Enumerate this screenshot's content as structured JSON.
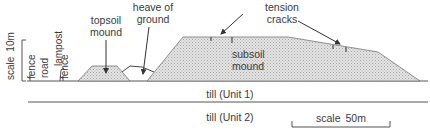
{
  "diagram": {
    "type": "geological cross-section",
    "colors": {
      "line": "#555555",
      "fill": "#d9d9d9",
      "text": "#3a3a3a"
    },
    "vertical_scale": {
      "label": "scale",
      "value": "10m"
    },
    "horizontal_scale": {
      "label": "scale",
      "value": "50m"
    },
    "features": {
      "fence_left": "fence",
      "road": "road",
      "lampost": "lampost",
      "fence_right": "fence",
      "topsoil_line1": "topsoil",
      "topsoil_line2": "mound",
      "heave_line1": "heave of",
      "heave_line2": "ground",
      "tension_line1": "tension",
      "tension_line2": "cracks",
      "subsoil_line1": "subsoil",
      "subsoil_line2": "mound"
    },
    "layers": {
      "unit1": "till (Unit 1)",
      "unit2": "till (Unit 2)"
    }
  }
}
